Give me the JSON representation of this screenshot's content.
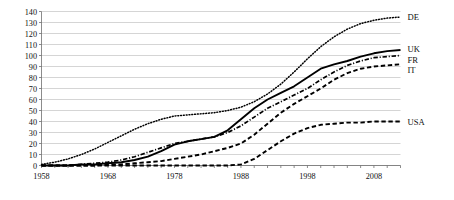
{
  "chart_data": {
    "type": "line",
    "title": "",
    "subtitle": "",
    "xlabel": "",
    "ylabel": "",
    "xlim": [
      1958,
      2012
    ],
    "ylim": [
      0,
      140
    ],
    "ytick_step": 10,
    "yticks": [
      0,
      10,
      20,
      30,
      40,
      50,
      60,
      70,
      80,
      90,
      100,
      110,
      120,
      130,
      140
    ],
    "xticks": [
      1958,
      1968,
      1978,
      1988,
      1998,
      2008
    ],
    "grid": "horizontal",
    "legend_position": "right-inline",
    "x": [
      1958,
      1960,
      1962,
      1964,
      1966,
      1968,
      1970,
      1972,
      1974,
      1976,
      1978,
      1980,
      1982,
      1984,
      1986,
      1988,
      1990,
      1992,
      1994,
      1996,
      1998,
      2000,
      2002,
      2004,
      2006,
      2008,
      2010,
      2012
    ],
    "series": [
      {
        "name": "DE",
        "label": "DE",
        "style": "dotted",
        "color": "#000000",
        "values": [
          1,
          3,
          6,
          10,
          15,
          21,
          27,
          33,
          38,
          42,
          45,
          46,
          47,
          48,
          50,
          53,
          58,
          65,
          74,
          85,
          97,
          108,
          117,
          124,
          129,
          132,
          134,
          135
        ]
      },
      {
        "name": "UK",
        "label": "UK",
        "style": "solid",
        "color": "#000000",
        "values": [
          0,
          0,
          0,
          1,
          1,
          2,
          3,
          5,
          8,
          13,
          19,
          22,
          24,
          26,
          32,
          42,
          52,
          60,
          66,
          72,
          80,
          88,
          92,
          95,
          99,
          102,
          104,
          105
        ]
      },
      {
        "name": "FR",
        "label": "FR",
        "style": "dash-dot",
        "color": "#000000",
        "values": [
          0,
          0,
          0,
          1,
          2,
          3,
          5,
          8,
          12,
          16,
          20,
          22,
          24,
          26,
          30,
          36,
          44,
          52,
          58,
          64,
          70,
          78,
          85,
          91,
          95,
          98,
          99,
          100
        ]
      },
      {
        "name": "IT",
        "label": "IT",
        "style": "dashed",
        "color": "#000000",
        "values": [
          0,
          0,
          0,
          0,
          0,
          1,
          1,
          2,
          3,
          4,
          6,
          8,
          10,
          13,
          16,
          20,
          28,
          38,
          48,
          56,
          63,
          70,
          78,
          84,
          88,
          90,
          91,
          92
        ]
      },
      {
        "name": "USA",
        "label": "USA",
        "style": "dashed",
        "color": "#000000",
        "values": [
          0,
          0,
          0,
          0,
          0,
          0,
          0,
          0,
          0,
          0,
          0,
          0,
          0,
          0,
          0,
          1,
          6,
          14,
          22,
          29,
          34,
          37,
          38,
          39,
          39,
          40,
          40,
          40
        ]
      }
    ],
    "legend_entries": [
      {
        "label": "DE",
        "value_at_end": 135
      },
      {
        "label": "UK",
        "value_at_end": 105
      },
      {
        "label": "FR",
        "value_at_end": 100
      },
      {
        "label": "IT",
        "value_at_end": 92
      },
      {
        "label": "USA",
        "value_at_end": 40
      }
    ]
  }
}
